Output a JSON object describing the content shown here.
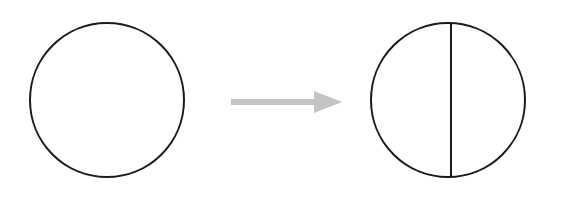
{
  "canvas": {
    "width": 566,
    "height": 200,
    "background_color": "#ffffff"
  },
  "diagram": {
    "title": "Whole circle transformed into a circle divided in two by a vertical diameter",
    "type": "transformation-diagram",
    "colors": {
      "outline": "#1a1a1a",
      "divider": "#1a1a1a",
      "arrow": "#c4c4c4",
      "background": "#ffffff"
    },
    "left_shape": {
      "name": "undivided-circle",
      "shape": "circle",
      "center_x": 107,
      "center_y": 100,
      "radius": 77,
      "stroke_color": "#1a1a1a",
      "stroke_width": 2,
      "fill": "none",
      "parts": 1
    },
    "arrow": {
      "name": "transformation-arrow",
      "direction": "right",
      "color": "#c4c4c4",
      "shaft_start_x": 231,
      "shaft_end_x": 319,
      "shaft_y": 102,
      "shaft_thickness": 6,
      "head_tip_x": 342,
      "head_back_x": 314,
      "head_half_height": 11
    },
    "right_shape": {
      "name": "divided-circle",
      "shape": "circle",
      "center_x": 448,
      "center_y": 100,
      "radius": 77,
      "stroke_color": "#1a1a1a",
      "stroke_width": 2,
      "fill": "none",
      "parts": 2,
      "divider": {
        "name": "vertical-diameter",
        "orientation": "vertical",
        "x": 451,
        "y_top": 24,
        "y_bottom": 177,
        "stroke_color": "#1a1a1a",
        "stroke_width": 2
      }
    }
  }
}
